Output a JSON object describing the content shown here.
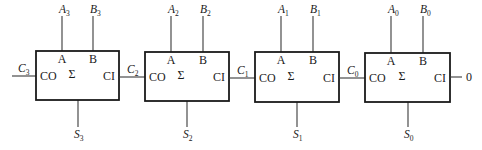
{
  "diagram": {
    "type": "4-bit ripple carry adder (full adder chain)",
    "carry_in_constant": "0",
    "stroke_color": "#1a1a1a",
    "adders": [
      {
        "index": 3,
        "box": {
          "x": 36,
          "y": 51,
          "w": 83,
          "h": 49
        },
        "port_a": "A",
        "port_b": "B",
        "port_co": "CO",
        "port_ci": "CI",
        "symbol": "Σ",
        "input_a": {
          "name": "A",
          "sub": "3"
        },
        "input_b": {
          "name": "B",
          "sub": "3"
        },
        "sum_out": {
          "name": "S",
          "sub": "3"
        },
        "carry_out": {
          "name": "C",
          "sub": "3"
        }
      },
      {
        "index": 2,
        "box": {
          "x": 145,
          "y": 52,
          "w": 84,
          "h": 49
        },
        "port_a": "A",
        "port_b": "B",
        "port_co": "CO",
        "port_ci": "CI",
        "symbol": "Σ",
        "input_a": {
          "name": "A",
          "sub": "2"
        },
        "input_b": {
          "name": "B",
          "sub": "2"
        },
        "sum_out": {
          "name": "S",
          "sub": "2"
        },
        "carry_out": {
          "name": "C",
          "sub": "2"
        }
      },
      {
        "index": 1,
        "box": {
          "x": 255,
          "y": 52,
          "w": 84,
          "h": 50
        },
        "port_a": "A",
        "port_b": "B",
        "port_co": "CO",
        "port_ci": "CI",
        "symbol": "Σ",
        "input_a": {
          "name": "A",
          "sub": "1"
        },
        "input_b": {
          "name": "B",
          "sub": "1"
        },
        "sum_out": {
          "name": "S",
          "sub": "1"
        },
        "carry_out": {
          "name": "C",
          "sub": "1"
        }
      },
      {
        "index": 0,
        "box": {
          "x": 365,
          "y": 53,
          "w": 85,
          "h": 49
        },
        "port_a": "A",
        "port_b": "B",
        "port_co": "CO",
        "port_ci": "CI",
        "symbol": "Σ",
        "input_a": {
          "name": "A",
          "sub": "0"
        },
        "input_b": {
          "name": "B",
          "sub": "0"
        },
        "sum_out": {
          "name": "S",
          "sub": "0"
        },
        "carry_out": {
          "name": "C",
          "sub": "0"
        }
      }
    ]
  }
}
